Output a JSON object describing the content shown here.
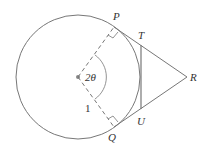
{
  "diagram": {
    "type": "geometry",
    "labels": {
      "P": "P",
      "T": "T",
      "R": "R",
      "U": "U",
      "Q": "Q",
      "angle": "2θ",
      "radius": "1"
    },
    "colors": {
      "stroke": "#777777",
      "text": "#333333",
      "background": "#ffffff"
    }
  }
}
